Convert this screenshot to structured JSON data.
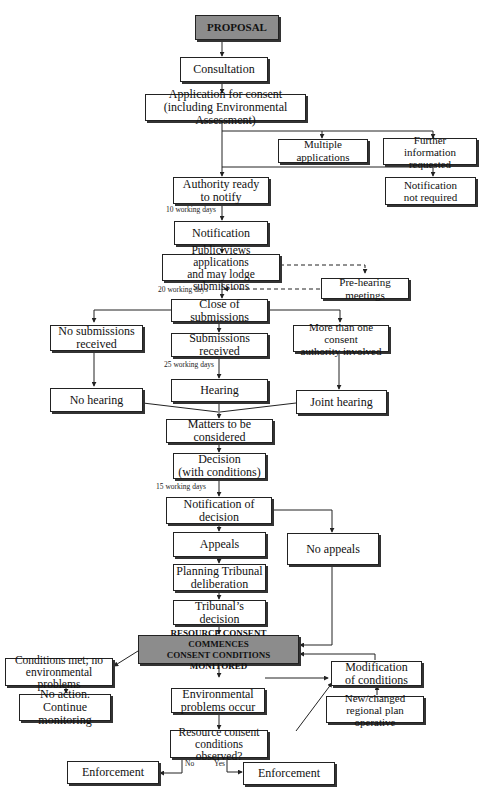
{
  "diagram": {
    "nodes": {
      "proposal": "PROPOSAL",
      "consultation": "Consultation",
      "application": "Application for consent\n(including Environmental Assessment)",
      "multiple_applications": "Multiple applications",
      "further_information": "Further\ninformation requested",
      "authority_ready": "Authority ready\nto notify",
      "notification_not_required": "Notification\nnot required",
      "notification": "Notification",
      "public_views": "Public views applications\nand may lodge submissions",
      "pre_hearing": "Pre-hearing meetings",
      "close_submissions": "Close of submissions",
      "no_submissions": "No submissions\nreceived",
      "submissions_received": "Submissions received",
      "more_than_one": "More than one consent\nauthority involved",
      "hearing": "Hearing",
      "no_hearing": "No hearing",
      "joint_hearing": "Joint hearing",
      "matters": "Matters to be considered",
      "decision": "Decision\n(with conditions)",
      "notification_decision": "Notification of decision",
      "appeals": "Appeals",
      "no_appeals": "No appeals",
      "tribunal_deliberation": "Planning Tribunal\ndeliberation",
      "tribunal_decision": "Tribunal’s decision",
      "resource_consent": "RESOURCE CONSENT COMMENCES\nCONSENT CONDITIONS MONITORED",
      "conditions_met": "Conditions met; no\nenvironmental problems",
      "no_action": "No action.\nContinue monitoring",
      "modification": "Modification\nof conditions",
      "new_plan": "New/changed\nregional plan operative",
      "env_problems": "Environmental\nproblems occur",
      "conditions_observed": "Resource consent\nconditions observed?",
      "enforcement_no": "Enforcement",
      "enforcement_yes": "Enforcement"
    },
    "notes": {
      "days_10": "10 working days",
      "days_20": "20 working days",
      "days_25": "25 working days",
      "days_15": "15 working days"
    },
    "branch_labels": {
      "no": "No",
      "yes": "Yes"
    },
    "colors": {
      "highlight_box": "#8c8c8c",
      "box": "#ffffff",
      "line": "#222222"
    }
  }
}
